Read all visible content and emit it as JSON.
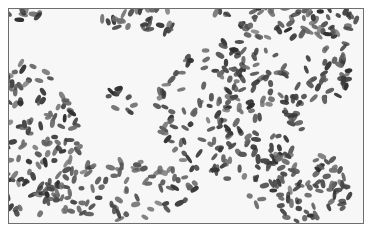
{
  "image": {
    "subject": "bacterial-cells-micrograph",
    "background_color": "#f7f7f7",
    "cell_color_dark": "#3a3a3a",
    "cell_color_mid": "#6a6a6a",
    "frame_color": "#6e6e6e",
    "clusters": [
      {
        "cx": 30,
        "cy": 140,
        "rx": 50,
        "ry": 80,
        "n": 140
      },
      {
        "cx": 230,
        "cy": 110,
        "rx": 75,
        "ry": 70,
        "n": 200
      },
      {
        "cx": 120,
        "cy": 190,
        "rx": 80,
        "ry": 30,
        "n": 90
      },
      {
        "cx": 280,
        "cy": 20,
        "rx": 80,
        "ry": 18,
        "n": 70
      },
      {
        "cx": 140,
        "cy": 20,
        "rx": 40,
        "ry": 15,
        "n": 30
      },
      {
        "cx": 300,
        "cy": 185,
        "rx": 55,
        "ry": 35,
        "n": 90
      },
      {
        "cx": 330,
        "cy": 70,
        "rx": 25,
        "ry": 40,
        "n": 40
      },
      {
        "cx": 20,
        "cy": 12,
        "rx": 20,
        "ry": 8,
        "n": 10
      },
      {
        "cx": 120,
        "cy": 100,
        "rx": 15,
        "ry": 15,
        "n": 10
      }
    ]
  }
}
